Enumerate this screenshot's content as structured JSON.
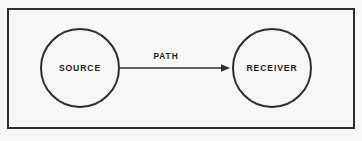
{
  "figure": {
    "background_color": "#f7f7f5",
    "stroke_color": "#2f2f2f",
    "text_color": "#1d1d1d",
    "frame": {
      "x": 7,
      "y": 8,
      "width": 348,
      "height": 121,
      "stroke_width": 2
    }
  },
  "nodes": [
    {
      "id": "source",
      "label": "SOURCE",
      "shape": "circle",
      "cx": 80,
      "cy": 68,
      "r": 40,
      "stroke_width": 2
    },
    {
      "id": "receiver",
      "label": "RECEIVER",
      "shape": "circle",
      "cx": 272,
      "cy": 68,
      "r": 40,
      "stroke_width": 2
    }
  ],
  "edges": [
    {
      "id": "path",
      "label": "PATH",
      "from": "source",
      "to": "receiver",
      "x1": 120,
      "x2": 230,
      "y": 68,
      "stroke_width": 1.6,
      "arrowhead": "solid-triangle",
      "label_x": 166,
      "label_y": 57
    }
  ]
}
